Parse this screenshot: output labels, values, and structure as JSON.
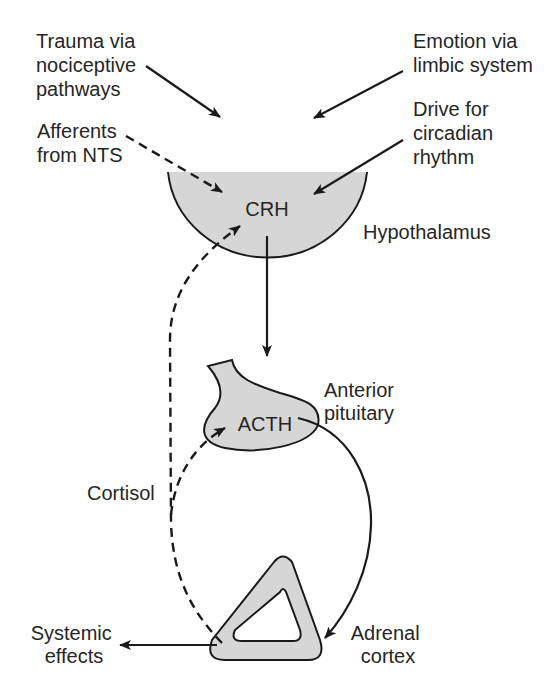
{
  "diagram": {
    "colors": {
      "organ_fill": "#d6d6d6",
      "line": "#1a1a1a",
      "text": "#262626"
    },
    "inputs": {
      "trauma": {
        "line1": "Trauma via",
        "line2": "nociceptive",
        "line3": "pathways",
        "arrow": "solid"
      },
      "emotion": {
        "line1": "Emotion via",
        "line2": "limbic system",
        "arrow": "solid"
      },
      "afferents": {
        "line1": "Afferents",
        "line2": "from NTS",
        "arrow": "dashed"
      },
      "circadian": {
        "line1": "Drive for",
        "line2": "circadian",
        "line3": "rhythm",
        "arrow": "solid"
      }
    },
    "hypothalamus": {
      "hormone": "CRH",
      "label": "Hypothalamus"
    },
    "pituitary": {
      "hormone": "ACTH",
      "label_line1": "Anterior",
      "label_line2": "pituitary"
    },
    "adrenal": {
      "label_line1": "Adrenal",
      "label_line2": "cortex"
    },
    "feedback": {
      "label": "Cortisol",
      "style": "dashed"
    },
    "output": {
      "line1": "Systemic",
      "line2": "effects"
    }
  }
}
